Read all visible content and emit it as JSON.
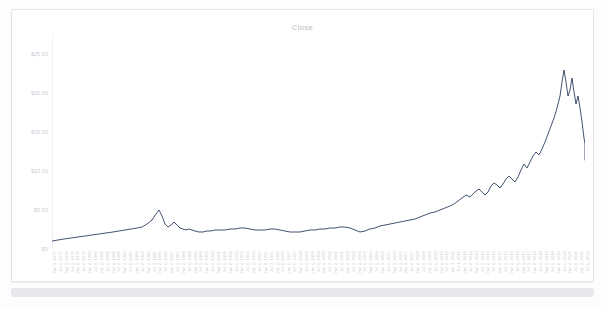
{
  "card": {
    "border_color": "#e3e5e8",
    "background": "#ffffff"
  },
  "scrollbar": {
    "orientation": "horizontal",
    "thumb_label": ""
  },
  "chart_data": {
    "type": "line",
    "title": "Close",
    "xlabel": "",
    "ylabel": "",
    "grid": false,
    "legend": "none",
    "line_color": "#2c3e63",
    "line_width": 0.9,
    "ylim": [
      0,
      27.5
    ],
    "yticks": [
      5.0,
      10.0,
      15.0,
      20.0,
      25.0
    ],
    "ytick_labels": [
      "$5.00",
      "$10.00",
      "$15.00",
      "$20.00",
      "$25.00"
    ],
    "ytick_zero_label": "$0",
    "x": [
      "Jan 3, 1977",
      "Jul 1, 1977",
      "Jan 3, 1978",
      "Jul 3, 1978",
      "Jan 2, 1979",
      "Jul 2, 1979",
      "Jan 2, 1980",
      "Jul 1, 1980",
      "Jan 2, 1981",
      "Jul 1, 1981",
      "Jan 4, 1982",
      "Jul 1, 1982",
      "Jan 3, 1983",
      "Jul 1, 1983",
      "Jan 3, 1984",
      "Jul 2, 1984",
      "Jan 2, 1985",
      "Jul 1, 1985",
      "Jan 2, 1986",
      "Jul 1, 1986",
      "Jan 2, 1987",
      "Jul 1, 1987",
      "Jan 4, 1988",
      "Jul 1, 1988",
      "Jan 3, 1989",
      "Jul 3, 1989",
      "Jan 2, 1990",
      "Jul 2, 1990",
      "Jan 2, 1991",
      "Jul 1, 1991",
      "Jan 2, 1992",
      "Jul 1, 1992",
      "Jan 4, 1993",
      "Jul 1, 1993",
      "Jan 3, 1994",
      "Jul 1, 1994",
      "Jan 3, 1995",
      "Jul 3, 1995",
      "Jan 2, 1996",
      "Jul 1, 1996",
      "Jan 2, 1997",
      "Jul 1, 1997",
      "Jan 2, 1998",
      "Jul 1, 1998",
      "Jan 4, 1999",
      "Jul 1, 1999",
      "Jan 3, 2000",
      "Jul 3, 2000",
      "Jan 2, 2001",
      "Jul 2, 2001",
      "Jan 2, 2002",
      "Jul 1, 2002",
      "Jan 2, 2003",
      "Jul 1, 2003",
      "Jan 2, 2004",
      "Jul 1, 2004",
      "Jan 3, 2005",
      "Jul 1, 2005",
      "Jan 3, 2006",
      "Jul 3, 2006",
      "Jan 3, 2007",
      "Jul 2, 2007",
      "Jan 2, 2008",
      "Jul 1, 2008",
      "Jan 2, 2009",
      "Jul 1, 2009",
      "Jan 4, 2010",
      "Jul 1, 2010",
      "Jan 3, 2011",
      "Jul 1, 2011",
      "Jan 3, 2012",
      "Jul 2, 2012",
      "Jan 2, 2013",
      "Jul 1, 2013",
      "Jan 2, 2014",
      "Jul 1, 2014",
      "Jan 2, 2015",
      "Jul 1, 2015",
      "Jan 4, 2016",
      "Jul 1, 2016",
      "Jan 3, 2017",
      "Jul 3, 2017",
      "Jan 2, 2018",
      "Jul 2, 2018",
      "Jan 2, 2019",
      "Jul 1, 2019",
      "Jan 2, 2020",
      "Jul 1, 2020",
      "Jan 4, 2021",
      "Jul 1, 2021",
      "Jan 3, 2022",
      "Jul 1, 2022"
    ],
    "series": [
      {
        "name": "Close",
        "values": [
          0.35,
          0.38,
          0.4,
          0.42,
          0.45,
          0.48,
          0.5,
          0.52,
          0.55,
          0.58,
          0.6,
          0.62,
          0.65,
          0.7,
          0.72,
          0.75,
          0.8,
          0.85,
          0.92,
          1.05,
          1.35,
          1.8,
          1.4,
          1.22,
          1.18,
          1.25,
          1.15,
          1.1,
          1.08,
          1.12,
          1.05,
          1.02,
          1.0,
          0.98,
          1.0,
          1.02,
          1.05,
          1.08,
          1.1,
          1.12,
          1.15,
          1.18,
          1.12,
          1.1,
          1.08,
          1.1,
          1.12,
          1.15,
          1.05,
          1.0,
          0.98,
          0.95,
          0.98,
          1.02,
          1.05,
          1.08,
          1.1,
          1.12,
          1.15,
          1.18,
          1.22,
          1.25,
          1.2,
          1.05,
          0.95,
          1.05,
          1.15,
          1.2,
          1.3,
          1.35,
          1.45,
          1.52,
          1.6,
          1.7,
          1.85,
          2.0,
          2.2,
          2.4,
          2.35,
          2.6,
          2.95,
          3.4,
          3.9,
          4.3,
          4.1,
          4.8,
          5.6,
          7.2,
          12.5,
          17.5,
          21.0,
          14.5
        ]
      }
    ],
    "path_points": "0,207 6,206 12,205 19,204 26,203 33,202 40,201 47,200 54,199 61,198 67,197 73,196 79,195 85,194 90,193 95,190 100,186 104,180 107,176 110,182 113,190 116,193 119,191 122,188 125,191 128,194 131,195 134,196 137,195 140,196 143,197 147,198 151,198 155,197 159,197 163,196 168,196 173,196 178,195 183,195 188,194 193,194 198,195 203,196 208,196 213,196 218,195 223,195 228,196 233,197 238,198 243,198 248,198 253,197 258,196 263,196 268,195 273,195 278,194 283,194 288,193 293,193 298,194 303,196 308,198 313,197 318,195 323,194 328,192 333,191 338,190 343,189 348,188 353,187 358,186 363,185 368,183 373,181 378,179 383,178 388,176 393,174 398,172 402,170 406,167 410,164 414,161 418,163 421,160 424,157 427,155 430,158 433,161 436,158 439,152 442,149 445,151 448,154 451,150 454,145 457,142 460,145 463,148 466,143 469,136 472,130 475,134 478,128 481,122 484,118 487,121 490,115 493,108 496,100 499,92 502,84 505,74 508,62 510,48 512,36 514,48 516,62 518,56 520,44 522,58 524,70 526,62 528,74 530,88 531,96 532,104 533,110 533,118 533,126"
  }
}
